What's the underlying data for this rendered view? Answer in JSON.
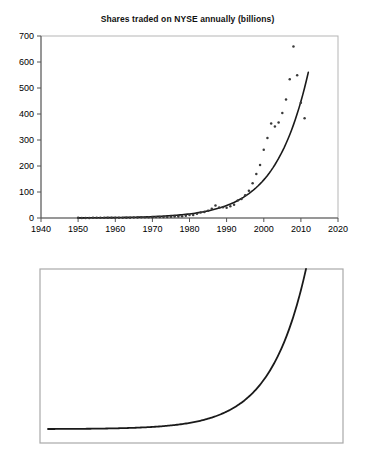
{
  "figures": [
    {
      "id": "shares",
      "title": "Shares traded on NYSE annually (billions)"
    },
    {
      "id": "rate",
      "title": "Rate of change"
    }
  ],
  "chart_data": [
    {
      "type": "scatter",
      "title": "Shares traded on NYSE annually (billions)",
      "xlabel": "",
      "ylabel": "",
      "xlim": [
        1940,
        2020
      ],
      "ylim": [
        0,
        700
      ],
      "xticks": [
        1940,
        1950,
        1960,
        1970,
        1980,
        1990,
        2000,
        2010,
        2020
      ],
      "yticks": [
        0,
        100,
        200,
        300,
        400,
        500,
        600,
        700
      ],
      "grid": false,
      "legend": null,
      "marker_color": "#3a3a3a",
      "line_color": "#1a1a1a",
      "series": [
        {
          "name": "Shares traded (billions)",
          "type": "scatter",
          "x": [
            1950,
            1951,
            1952,
            1953,
            1954,
            1955,
            1956,
            1957,
            1958,
            1959,
            1960,
            1961,
            1962,
            1963,
            1964,
            1965,
            1966,
            1967,
            1968,
            1969,
            1970,
            1971,
            1972,
            1973,
            1974,
            1975,
            1976,
            1977,
            1978,
            1979,
            1980,
            1981,
            1982,
            1983,
            1984,
            1985,
            1986,
            1987,
            1988,
            1989,
            1990,
            1991,
            1992,
            1993,
            1994,
            1995,
            1996,
            1997,
            1998,
            1999,
            2000,
            2001,
            2002,
            2003,
            2004,
            2005,
            2006,
            2007,
            2008,
            2009,
            2010,
            2011
          ],
          "y": [
            0.5,
            0.4,
            0.3,
            0.3,
            0.6,
            0.6,
            0.6,
            0.6,
            0.7,
            0.8,
            0.8,
            1.0,
            0.9,
            1.1,
            1.2,
            1.6,
            1.9,
            2.5,
            3.0,
            2.9,
            2.9,
            3.9,
            4.1,
            4.1,
            3.5,
            4.7,
            5.4,
            5.3,
            7.2,
            8.2,
            11.6,
            11.9,
            16.5,
            21.6,
            23.1,
            27.5,
            35.7,
            47.8,
            40.8,
            41.7,
            39.7,
            45.3,
            51.4,
            66.9,
            73.4,
            87.2,
            104.6,
            133.3,
            169.7,
            203.9,
            262.5,
            307.5,
            363.1,
            352.4,
            367.1,
            403.8,
            456.0,
            534.0,
            660.0,
            549.0,
            443.0,
            384.0
          ]
        },
        {
          "name": "Exponential trend",
          "type": "line",
          "description": "Smooth fitted exponential growth curve rising from near 0 in 1950 to about 560 billion at 2012"
        }
      ]
    },
    {
      "type": "line",
      "title": "Rate of change",
      "xlabel": "",
      "ylabel": "",
      "xticks": [],
      "yticks": [],
      "grid": false,
      "legend": null,
      "line_color": "#1a1a1a",
      "series": [
        {
          "name": "Rate of change",
          "type": "line",
          "description": "Derivative of the exponential trend: flat near the baseline across the left two-thirds, then curving sharply upward and exiting the top of the frame near the right edge"
        }
      ]
    }
  ]
}
